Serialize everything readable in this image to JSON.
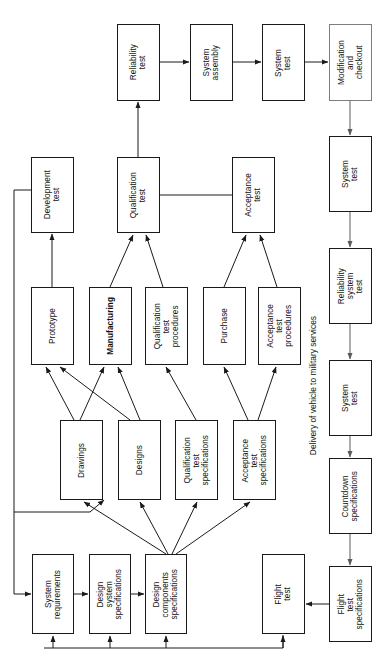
{
  "diagram": {
    "orientation": "rotated-90",
    "colors": {
      "stroke": "#1a1a1a",
      "faint_stroke": "#7d7d7d",
      "background": "#ffffff",
      "text": "#111111"
    },
    "annotations": [
      {
        "id": "delivery-note",
        "text": "Delivery of vehicle to military services"
      }
    ],
    "nodes": [
      {
        "id": "reliability-test",
        "label": "Reliability\ntest",
        "x": 117,
        "y": 24,
        "w": 43,
        "h": 77,
        "faint": false,
        "bold": false
      },
      {
        "id": "system-assembly",
        "label": "System\nassembly",
        "x": 190,
        "y": 24,
        "w": 43,
        "h": 77,
        "faint": false,
        "bold": false
      },
      {
        "id": "system-test-top",
        "label": "System\ntest",
        "x": 262,
        "y": 24,
        "w": 43,
        "h": 77,
        "faint": false,
        "bold": false
      },
      {
        "id": "modification-and-checkout",
        "label": "Modification\nand\ncheckout",
        "x": 329,
        "y": 24,
        "w": 43,
        "h": 77,
        "faint": true,
        "bold": false
      },
      {
        "id": "development-test",
        "label": "Development\ntest",
        "x": 31,
        "y": 157,
        "w": 43,
        "h": 76,
        "faint": false,
        "bold": false
      },
      {
        "id": "qualification-test",
        "label": "Qualification\ntest",
        "x": 117,
        "y": 157,
        "w": 43,
        "h": 76,
        "faint": false,
        "bold": false
      },
      {
        "id": "acceptance-test",
        "label": "Acceptance\ntest",
        "x": 232,
        "y": 157,
        "w": 43,
        "h": 76,
        "faint": false,
        "bold": false
      },
      {
        "id": "system-test-second",
        "label": "System\ntest",
        "x": 329,
        "y": 136,
        "w": 43,
        "h": 76,
        "faint": false,
        "bold": false
      },
      {
        "id": "prototype",
        "label": "Prototype",
        "x": 31,
        "y": 287,
        "w": 43,
        "h": 78,
        "faint": false,
        "bold": false
      },
      {
        "id": "manufacturing",
        "label": "Manufacturing",
        "x": 89,
        "y": 287,
        "w": 43,
        "h": 78,
        "faint": false,
        "bold": true
      },
      {
        "id": "qualification-test-procedures",
        "label": "Qualification\ntest\nprocedures",
        "x": 145,
        "y": 287,
        "w": 43,
        "h": 78,
        "faint": false,
        "bold": false
      },
      {
        "id": "purchase",
        "label": "Purchase",
        "x": 203,
        "y": 287,
        "w": 43,
        "h": 78,
        "faint": false,
        "bold": false
      },
      {
        "id": "acceptance-test-procedures",
        "label": "Acceptance\ntest\nprocedures",
        "x": 258,
        "y": 287,
        "w": 43,
        "h": 78,
        "faint": false,
        "bold": false
      },
      {
        "id": "reliability-system-test",
        "label": "Reliability\nsystem\ntest",
        "x": 329,
        "y": 248,
        "w": 43,
        "h": 76,
        "faint": false,
        "bold": false
      },
      {
        "id": "drawings",
        "label": "Drawings",
        "x": 60,
        "y": 420,
        "w": 43,
        "h": 80,
        "faint": false,
        "bold": false
      },
      {
        "id": "designs",
        "label": "Designs",
        "x": 118,
        "y": 420,
        "w": 43,
        "h": 80,
        "faint": false,
        "bold": false
      },
      {
        "id": "qualification-test-specifications",
        "label": "Qualification\ntest\nspecifications",
        "x": 175,
        "y": 420,
        "w": 43,
        "h": 80,
        "faint": false,
        "bold": false
      },
      {
        "id": "acceptance-test-specifications",
        "label": "Acceptance\ntest\nspecifications",
        "x": 233,
        "y": 420,
        "w": 43,
        "h": 80,
        "faint": false,
        "bold": false
      },
      {
        "id": "system-test-third",
        "label": "System\ntest",
        "x": 329,
        "y": 360,
        "w": 43,
        "h": 76,
        "faint": false,
        "bold": false
      },
      {
        "id": "countdown-specifications",
        "label": "Countdown\nspecifications",
        "x": 329,
        "y": 458,
        "w": 43,
        "h": 76,
        "faint": false,
        "bold": false
      },
      {
        "id": "system-requirements",
        "label": "System\nrequirements",
        "x": 32,
        "y": 554,
        "w": 42,
        "h": 80,
        "faint": false,
        "bold": false
      },
      {
        "id": "design-system-specifications",
        "label": "Design\nsystem\nspecifications",
        "x": 89,
        "y": 554,
        "w": 42,
        "h": 80,
        "faint": false,
        "bold": false
      },
      {
        "id": "design-components-specifications",
        "label": "Design\ncomponents\nspecifications",
        "x": 145,
        "y": 554,
        "w": 42,
        "h": 80,
        "faint": false,
        "bold": false
      },
      {
        "id": "flight-test",
        "label": "Flight\ntest",
        "x": 262,
        "y": 554,
        "w": 43,
        "h": 80,
        "faint": false,
        "bold": false
      },
      {
        "id": "flight-test-specifications",
        "label": "Flight\ntest\nspecifications",
        "x": 329,
        "y": 566,
        "w": 43,
        "h": 76,
        "faint": false,
        "bold": false
      }
    ],
    "edges": [
      {
        "from": "reliability-test",
        "to": "system-assembly"
      },
      {
        "from": "system-assembly",
        "to": "system-test-top"
      },
      {
        "from": "system-test-top",
        "to": "modification-and-checkout"
      },
      {
        "from": "modification-and-checkout",
        "to": "system-test-second"
      },
      {
        "from": "system-test-second",
        "to": "reliability-system-test"
      },
      {
        "from": "reliability-system-test",
        "to": "system-test-third"
      },
      {
        "from": "system-test-third",
        "to": "countdown-specifications"
      },
      {
        "from": "countdown-specifications",
        "to": "flight-test-specifications"
      },
      {
        "from": "flight-test-specifications",
        "to": "flight-test"
      },
      {
        "from": "qualification-test",
        "to": "reliability-test"
      },
      {
        "from": "qualification-test",
        "to": "acceptance-test"
      },
      {
        "from": "prototype",
        "to": "development-test"
      },
      {
        "from": "manufacturing",
        "to": "qualification-test"
      },
      {
        "from": "qualification-test-procedures",
        "to": "qualification-test"
      },
      {
        "from": "purchase",
        "to": "acceptance-test"
      },
      {
        "from": "acceptance-test-procedures",
        "to": "acceptance-test"
      },
      {
        "from": "drawings",
        "to": "prototype"
      },
      {
        "from": "drawings",
        "to": "manufacturing"
      },
      {
        "from": "designs",
        "to": "prototype"
      },
      {
        "from": "designs",
        "to": "manufacturing"
      },
      {
        "from": "qualification-test-specifications",
        "to": "qualification-test-procedures"
      },
      {
        "from": "acceptance-test-specifications",
        "to": "purchase"
      },
      {
        "from": "acceptance-test-specifications",
        "to": "acceptance-test-procedures"
      },
      {
        "from": "design-components-specifications",
        "to": "drawings"
      },
      {
        "from": "design-components-specifications",
        "to": "designs"
      },
      {
        "from": "design-components-specifications",
        "to": "qualification-test-specifications"
      },
      {
        "from": "design-components-specifications",
        "to": "acceptance-test-specifications"
      },
      {
        "from": "system-requirements",
        "to": "design-system-specifications"
      },
      {
        "from": "design-system-specifications",
        "to": "design-components-specifications"
      },
      {
        "from": "development-test",
        "to": "system-requirements"
      },
      {
        "from": "flight-test",
        "to": "system-requirements"
      },
      {
        "from": "flight-test",
        "to": "design-system-specifications"
      },
      {
        "from": "flight-test",
        "to": "design-components-specifications"
      }
    ]
  }
}
